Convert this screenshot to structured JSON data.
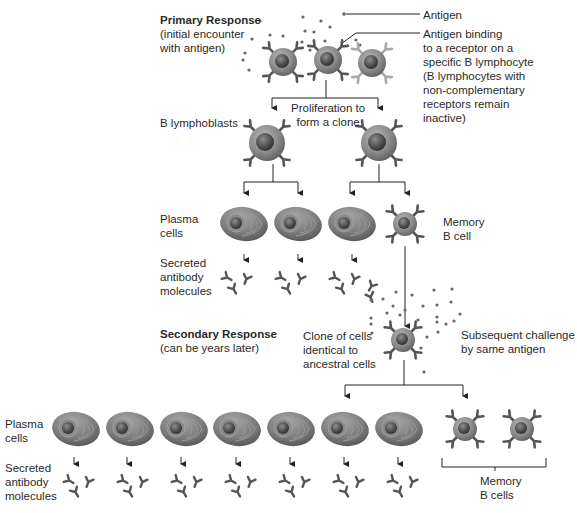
{
  "diagram": {
    "colors": {
      "line": "#222222",
      "cell_body": "#8a8a8a",
      "cell_nucleus": "#4a4a4a",
      "receptor_dark": "#555555",
      "receptor_light": "#a8a8a8",
      "antigen_dot": "#666666",
      "plasma_body": "#7c7c7c"
    },
    "primary": {
      "heading": "Primary Response",
      "subheading_line1": "(initial encounter",
      "subheading_line2": "with antigen)",
      "antigen_label": "Antigen",
      "binding_label": [
        "Antigen binding",
        "to a receptor on a",
        "specific B lymphocyte",
        "(B lymphocytes with",
        "non-complementary",
        "receptors remain",
        "inactive)"
      ],
      "proliferation_label_line1": "Proliferation to",
      "proliferation_label_line2": "form a clone",
      "lymphoblasts_label": "B lymphoblasts",
      "plasma_label_line1": "Plasma",
      "plasma_label_line2": "cells",
      "memory_label_line1": "Memory",
      "memory_label_line2": "B cell",
      "antibody_label_line1": "Secreted",
      "antibody_label_line2": "antibody",
      "antibody_label_line3": "molecules",
      "plasma_cell_count": 3,
      "memory_cell_count": 1
    },
    "secondary": {
      "heading": "Secondary Response",
      "subheading": "(can be years later)",
      "clone_label_line1": "Clone of cells",
      "clone_label_line2": "identical to",
      "clone_label_line3": "ancestral cells",
      "challenge_label_line1": "Subsequent challenge",
      "challenge_label_line2": "by same antigen",
      "plasma_label_line1": "Plasma",
      "plasma_label_line2": "cells",
      "antibody_label_line1": "Secreted",
      "antibody_label_line2": "antibody",
      "antibody_label_line3": "molecules",
      "memory_label_line1": "Memory",
      "memory_label_line2": "B cells",
      "plasma_cell_count": 7,
      "memory_cell_count": 2
    }
  }
}
